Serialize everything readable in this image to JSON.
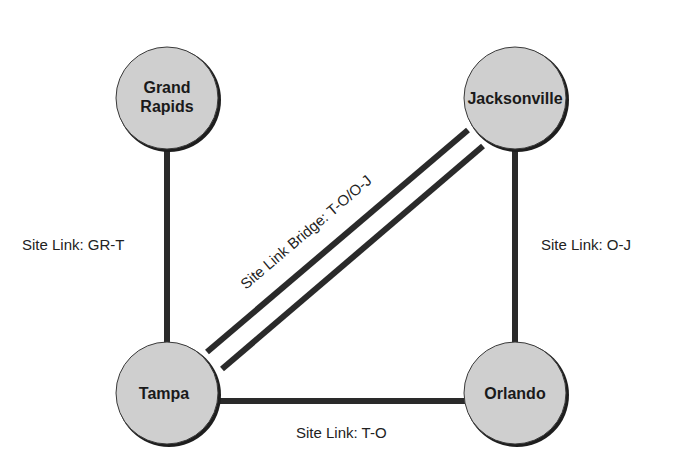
{
  "diagram": {
    "type": "site-link-topology",
    "colors": {
      "node_fill": "#cfcfcf",
      "node_stroke": "#1e1e1e",
      "link": "#2a2a2a",
      "text": "#1a1a1a",
      "background": "#ffffff"
    },
    "nodes": [
      {
        "id": "GR",
        "label_line1": "Grand",
        "label_line2": "Rapids",
        "cx": 167,
        "cy": 98
      },
      {
        "id": "J",
        "label_line1": "Jacksonville",
        "label_line2": "",
        "cx": 515,
        "cy": 98
      },
      {
        "id": "T",
        "label_line1": "Tampa",
        "label_line2": "",
        "cx": 167,
        "cy": 393
      },
      {
        "id": "O",
        "label_line1": "Orlando",
        "label_line2": "",
        "cx": 515,
        "cy": 393
      }
    ],
    "links": [
      {
        "id": "GR-T",
        "from": "GR",
        "to": "T",
        "label": "Site Link: GR-T"
      },
      {
        "id": "O-J",
        "from": "O",
        "to": "J",
        "label": "Site Link: O-J"
      },
      {
        "id": "T-O",
        "from": "T",
        "to": "O",
        "label": "Site Link: T-O"
      }
    ],
    "bridges": [
      {
        "id": "T-O/O-J",
        "from": "T",
        "to": "J",
        "label": "Site Link Bridge: T-O/O-J"
      }
    ]
  }
}
